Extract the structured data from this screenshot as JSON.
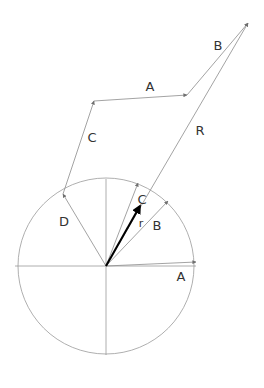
{
  "figure": {
    "background_color": "#ffffff",
    "line_color": "#8c8c8c",
    "bold_vector_color": "#000000",
    "label_color": "#333333",
    "width": 264,
    "height": 388
  },
  "circle": {
    "center_x": 106,
    "center_y": 266,
    "radius": 88,
    "stroke": "#9a9a9a"
  },
  "axes": {
    "horizontal": {
      "x1": 15,
      "y1": 266,
      "x2": 196,
      "y2": 266
    },
    "vertical": {
      "x1": 106,
      "y1": 179,
      "x2": 106,
      "y2": 355
    }
  },
  "vectors": [
    {
      "id": "vector-a-inner",
      "label": "A",
      "label_x": 181,
      "label_y": 277,
      "from_x": 106,
      "from_y": 266,
      "to_x": 196,
      "to_y": 262,
      "bold": false
    },
    {
      "id": "vector-b-inner",
      "label": "B",
      "label_x": 157,
      "label_y": 226,
      "from_x": 106,
      "from_y": 266,
      "to_x": 168,
      "to_y": 201,
      "bold": false
    },
    {
      "id": "vector-c-inner",
      "label": "C",
      "label_x": 142,
      "label_y": 200,
      "from_x": 106,
      "from_y": 266,
      "to_x": 138,
      "to_y": 183,
      "bold": false
    },
    {
      "id": "vector-d-inner",
      "label": "D",
      "label_x": 64,
      "label_y": 222,
      "from_x": 106,
      "from_y": 266,
      "to_x": 63,
      "to_y": 194,
      "bold": false
    },
    {
      "id": "vector-r-resultant",
      "label": "r",
      "label_x": 141,
      "label_y": 224,
      "from_x": 106,
      "from_y": 266,
      "to_x": 140,
      "to_y": 206,
      "bold": true
    }
  ],
  "outer_chain": {
    "vector_c_outer": {
      "label": "C",
      "label_x": 92,
      "label_y": 138,
      "from_x": 63,
      "from_y": 194,
      "to_x": 94,
      "to_y": 101
    },
    "vector_a_outer": {
      "label": "A",
      "label_x": 150,
      "label_y": 87,
      "from_x": 94,
      "from_y": 101,
      "to_x": 187,
      "to_y": 95
    },
    "vector_b_outer": {
      "label": "B",
      "label_x": 218,
      "label_y": 46,
      "from_x": 187,
      "from_y": 95,
      "to_x": 248,
      "to_y": 23
    },
    "vector_R_total": {
      "label": "R",
      "label_x": 200,
      "label_y": 131,
      "from_x": 106,
      "from_y": 266,
      "to_x": 248,
      "to_y": 23
    }
  },
  "chart_data": {
    "type": "scatter",
    "xlabel": "",
    "ylabel": "",
    "grid": false,
    "legend": "none",
    "annotations": [
      "A",
      "B",
      "C",
      "D",
      "r",
      "A",
      "B",
      "C",
      "R"
    ],
    "series": [
      {
        "name": "unit-circle",
        "kind": "circle",
        "center": [
          106,
          266
        ],
        "radius": 88
      },
      {
        "name": "axes",
        "kind": "lines",
        "points": [
          [
            15,
            266
          ],
          [
            196,
            266
          ],
          [
            106,
            179
          ],
          [
            106,
            355
          ]
        ]
      },
      {
        "name": "inner-component-vectors",
        "kind": "arrows",
        "origin": [
          106,
          266
        ],
        "tips": [
          [
            196,
            262
          ],
          [
            168,
            201
          ],
          [
            138,
            183
          ],
          [
            63,
            194
          ]
        ],
        "labels": [
          "A",
          "B",
          "C",
          "D"
        ]
      },
      {
        "name": "resultant-r",
        "kind": "arrow",
        "origin": [
          106,
          266
        ],
        "tip": [
          140,
          206
        ],
        "labels": [
          "r"
        ]
      },
      {
        "name": "tip-to-tail-chain",
        "kind": "polyline-arrows",
        "points": [
          [
            106,
            266
          ],
          [
            63,
            194
          ],
          [
            94,
            101
          ],
          [
            187,
            95
          ],
          [
            248,
            23
          ]
        ],
        "labels": [
          "D",
          "C",
          "A",
          "B"
        ]
      },
      {
        "name": "resultant-R",
        "kind": "arrow",
        "origin": [
          106,
          266
        ],
        "tip": [
          248,
          23
        ],
        "labels": [
          "R"
        ]
      }
    ]
  }
}
